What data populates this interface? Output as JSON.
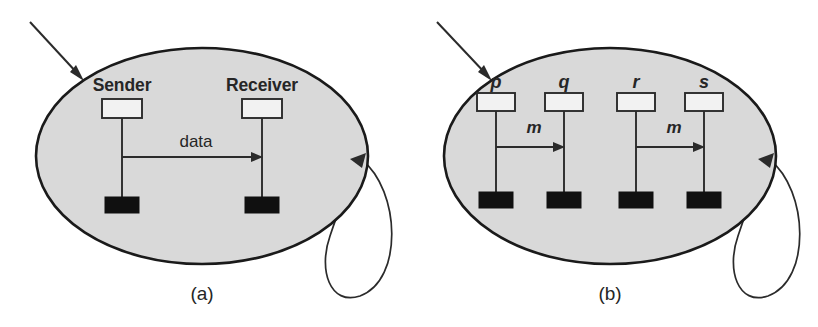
{
  "figure": {
    "width": 818,
    "height": 327,
    "background_color": "#ffffff",
    "ellipse_fill_color": "#d9d9d9",
    "stroke_color": "#2b2b2b",
    "terminator_color": "#101010"
  },
  "panels": [
    {
      "id": "panel-a",
      "caption": "(a)",
      "caption_x": 202,
      "caption_y": 300,
      "ellipse": {
        "cx": 202,
        "cy": 156,
        "rx": 166,
        "ry": 108
      },
      "incoming_arrow": {
        "name": "incoming-arrow",
        "x1": 30,
        "y1": 22,
        "x2": 81,
        "y2": 77
      },
      "self_loop": {
        "name": "self-loop-arrow",
        "tip_x": 364,
        "tip_y": 156
      },
      "participants": [
        {
          "label": "Sender",
          "label_x": 122,
          "label_y": 91,
          "lifeline_x": 122,
          "box_y": 99,
          "box_w": 40,
          "box_h": 19,
          "term_y": 197,
          "term_w": 34,
          "term_h": 16,
          "lifeline_bottom": 197
        },
        {
          "label": "Receiver",
          "label_x": 262,
          "label_y": 91,
          "lifeline_x": 262,
          "box_y": 99,
          "box_w": 40,
          "box_h": 19,
          "term_y": 197,
          "term_w": 34,
          "term_h": 16,
          "lifeline_bottom": 197
        }
      ],
      "messages": [
        {
          "label": "data",
          "italic": false,
          "from_x": 122,
          "to_x": 262,
          "y": 157,
          "label_x": 196,
          "label_y": 147
        }
      ]
    },
    {
      "id": "panel-b",
      "caption": "(b)",
      "caption_x": 610,
      "caption_y": 300,
      "ellipse": {
        "cx": 610,
        "cy": 156,
        "rx": 166,
        "ry": 108
      },
      "incoming_arrow": {
        "name": "incoming-arrow",
        "x1": 437,
        "y1": 22,
        "x2": 489,
        "y2": 77
      },
      "self_loop": {
        "name": "self-loop-arrow",
        "tip_x": 772,
        "tip_y": 156
      },
      "participants": [
        {
          "label": "p",
          "label_x": 496,
          "label_y": 88,
          "lifeline_x": 496,
          "box_y": 93,
          "box_w": 38,
          "box_h": 18,
          "term_y": 192,
          "term_w": 34,
          "term_h": 16,
          "lifeline_bottom": 192
        },
        {
          "label": "q",
          "label_x": 564,
          "label_y": 88,
          "lifeline_x": 564,
          "box_y": 93,
          "box_w": 38,
          "box_h": 18,
          "term_y": 192,
          "term_w": 34,
          "term_h": 16,
          "lifeline_bottom": 192
        },
        {
          "label": "r",
          "label_x": 636,
          "label_y": 88,
          "lifeline_x": 636,
          "box_y": 93,
          "box_w": 38,
          "box_h": 18,
          "term_y": 192,
          "term_w": 34,
          "term_h": 16,
          "lifeline_bottom": 192
        },
        {
          "label": "s",
          "label_x": 704,
          "label_y": 88,
          "lifeline_x": 704,
          "box_y": 93,
          "box_w": 38,
          "box_h": 18,
          "term_y": 192,
          "term_w": 34,
          "term_h": 16,
          "lifeline_bottom": 192
        }
      ],
      "messages": [
        {
          "label": "m",
          "italic": true,
          "from_x": 496,
          "to_x": 564,
          "y": 147,
          "label_x": 534,
          "label_y": 133
        },
        {
          "label": "m",
          "italic": true,
          "from_x": 636,
          "to_x": 704,
          "y": 147,
          "label_x": 674,
          "label_y": 133
        }
      ]
    }
  ]
}
